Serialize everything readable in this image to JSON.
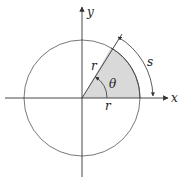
{
  "diagram": {
    "type": "circle-sector-arc-length",
    "labels": {
      "x_axis": "x",
      "y_axis": "y",
      "radius_on_ray": "r",
      "radius_on_axis": "r",
      "angle": "θ",
      "arc_length": "s"
    },
    "geometry": {
      "center": [
        82,
        98
      ],
      "radius": 58,
      "sector_angle_deg": 60
    },
    "colors": {
      "sector_fill": "#d9d9d9",
      "stroke": "#333333"
    }
  }
}
